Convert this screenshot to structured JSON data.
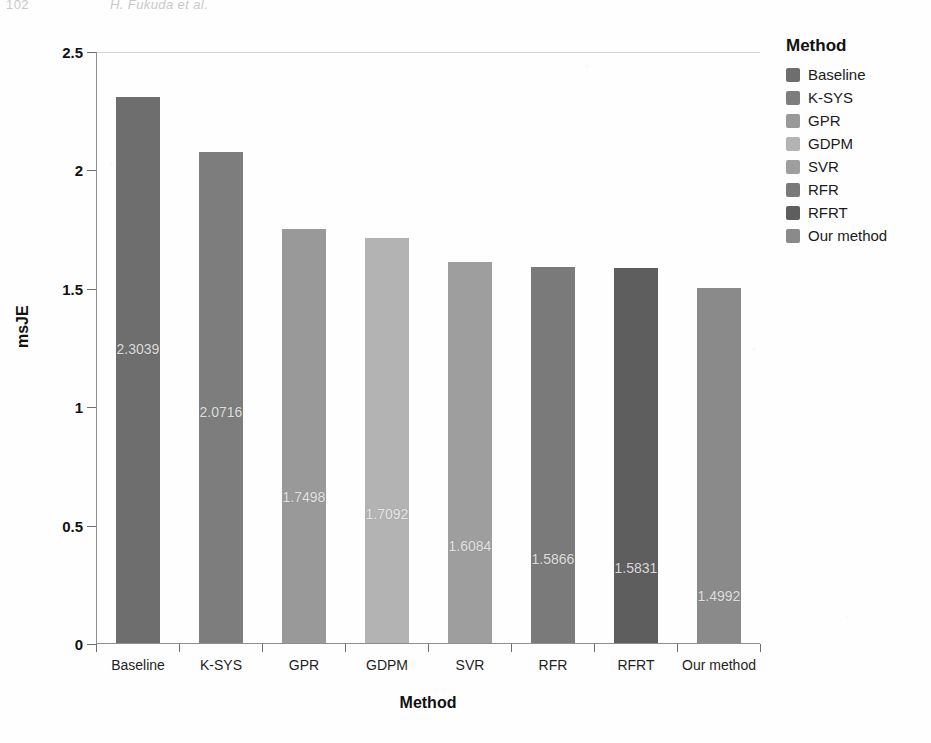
{
  "running_head": {
    "page_number": "102",
    "text": "H. Fukuda et al."
  },
  "chart_data": {
    "type": "bar",
    "title": "",
    "xlabel": "Method",
    "ylabel": "msJE",
    "categories": [
      "Baseline",
      "K-SYS",
      "GPR",
      "GDPM",
      "SVR",
      "RFR",
      "RFRT",
      "Our method"
    ],
    "values": [
      2.3039,
      2.0716,
      1.7498,
      1.7092,
      1.6084,
      1.5866,
      1.5831,
      1.4992
    ],
    "value_labels": [
      "2.3039",
      "2.0716",
      "1.7498",
      "1.7092",
      "1.6084",
      "1.5866",
      "1.5831",
      "1.4992"
    ],
    "ylim": [
      0,
      2.5
    ],
    "yticks": [
      0,
      0.5,
      1,
      1.5,
      2,
      2.5
    ],
    "ytick_labels": [
      "0",
      "0.5",
      "1",
      "1.5",
      "2",
      "2.5"
    ],
    "grid": false,
    "legend_position": "right",
    "colors": [
      "#6e6e6e",
      "#7d7d7d",
      "#999999",
      "#b3b3b3",
      "#9e9e9e",
      "#7a7a7a",
      "#5e5e5e",
      "#8a8a8a"
    ]
  },
  "legend": {
    "title": "Method",
    "items": [
      {
        "label": "Baseline",
        "color": "#6e6e6e"
      },
      {
        "label": "K-SYS",
        "color": "#7d7d7d"
      },
      {
        "label": "GPR",
        "color": "#999999"
      },
      {
        "label": "GDPM",
        "color": "#b3b3b3"
      },
      {
        "label": "SVR",
        "color": "#9e9e9e"
      },
      {
        "label": "RFR",
        "color": "#7a7a7a"
      },
      {
        "label": "RFRT",
        "color": "#5e5e5e"
      },
      {
        "label": "Our method",
        "color": "#8a8a8a"
      }
    ]
  }
}
